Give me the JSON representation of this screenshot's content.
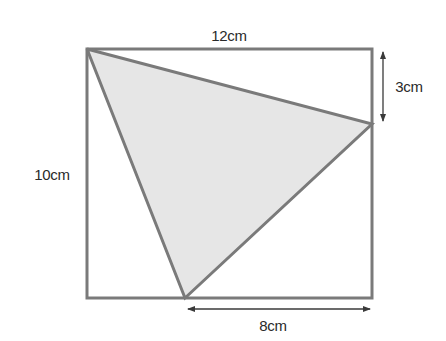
{
  "diagram": {
    "type": "geometry",
    "labels": {
      "top": "12cm",
      "left": "10cm",
      "right_segment": "3cm",
      "bottom_segment": "8cm"
    },
    "rectangle": {
      "width_cm": 12,
      "height_cm": 10
    },
    "triangle": {
      "vertices": [
        "top-left corner of rectangle",
        "point on right side 3cm below top",
        "point on bottom side 8cm from bottom-right corner"
      ],
      "shaded": true
    },
    "colors": {
      "stroke": "#7a7a7a",
      "fill": "#e6e6e6",
      "arrow": "#3a3a3a",
      "text": "#2a2a2a"
    }
  }
}
